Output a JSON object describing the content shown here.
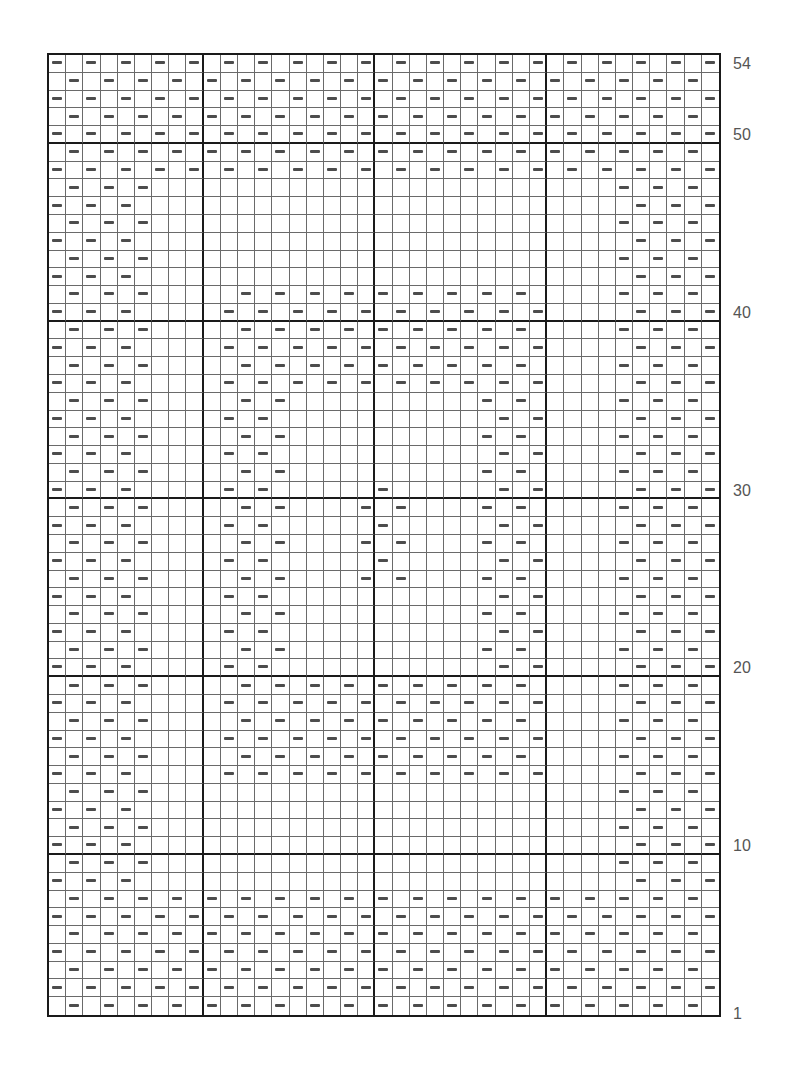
{
  "chart_data": {
    "type": "knitting-chart",
    "rows": 54,
    "cols": 39,
    "column_group_boundaries": [
      9,
      19,
      29
    ],
    "row_group_boundaries": [
      10,
      20,
      30,
      40,
      50
    ],
    "symbol": "purl-dash",
    "row_labels": [
      {
        "row": 54,
        "text": "54"
      },
      {
        "row": 50,
        "text": "50"
      },
      {
        "row": 40,
        "text": "40"
      },
      {
        "row": 30,
        "text": "30"
      },
      {
        "row": 20,
        "text": "20"
      },
      {
        "row": 10,
        "text": "10"
      },
      {
        "row": 1,
        "text": "1"
      }
    ],
    "dash_rule": "dash where (row+col) is odd inside regions; center motif uses (row+col) even",
    "regions": [
      {
        "name": "bottom-band",
        "rows": [
          1,
          7
        ],
        "cols": [
          1,
          39
        ]
      },
      {
        "name": "top-band",
        "rows": [
          48,
          54
        ],
        "cols": [
          1,
          39
        ]
      },
      {
        "name": "left-border",
        "rows": [
          8,
          47
        ],
        "cols": [
          1,
          6
        ]
      },
      {
        "name": "right-border",
        "rows": [
          8,
          47
        ],
        "cols": [
          34,
          39
        ]
      },
      {
        "name": "frame-bottom",
        "rows": [
          14,
          19
        ],
        "cols": [
          11,
          29
        ]
      },
      {
        "name": "frame-top",
        "rows": [
          36,
          41
        ],
        "cols": [
          11,
          29
        ]
      },
      {
        "name": "frame-left",
        "rows": [
          20,
          35
        ],
        "cols": [
          11,
          14
        ]
      },
      {
        "name": "frame-right",
        "rows": [
          20,
          35
        ],
        "cols": [
          26,
          29
        ]
      }
    ],
    "center_motif": [
      {
        "row": 30,
        "cols": [
          20
        ]
      },
      {
        "row": 29,
        "cols": [
          19,
          21
        ]
      },
      {
        "row": 28,
        "cols": [
          20
        ]
      },
      {
        "row": 27,
        "cols": [
          19,
          21
        ]
      },
      {
        "row": 26,
        "cols": [
          20
        ]
      },
      {
        "row": 25,
        "cols": [
          19,
          21
        ]
      }
    ]
  }
}
